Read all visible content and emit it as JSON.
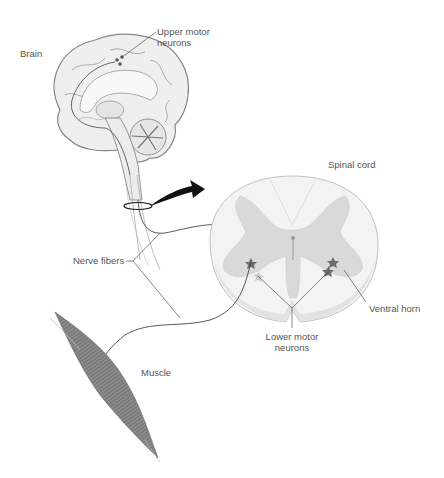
{
  "diagram": {
    "labels": {
      "brain": "Brain",
      "upper_motor_neurons_line1": "Upper motor",
      "upper_motor_neurons_line2": "neurons",
      "spinal_cord": "Spinal cord",
      "nerve_fibers": "Nerve fibers",
      "ventral_horn": "Ventral horn",
      "lower_motor_neurons_line1": "Lower motor",
      "lower_motor_neurons_line2": "neurons",
      "muscle": "Muscle"
    },
    "colors": {
      "line": "#444444",
      "brain_fill": "#eeeeee",
      "brain_stroke": "#888888",
      "grey_matter": "#d9d9d9",
      "white_matter": "#f4f4f4",
      "neuron": "#777777",
      "muscle": "#777777",
      "arrow": "#111111"
    }
  }
}
